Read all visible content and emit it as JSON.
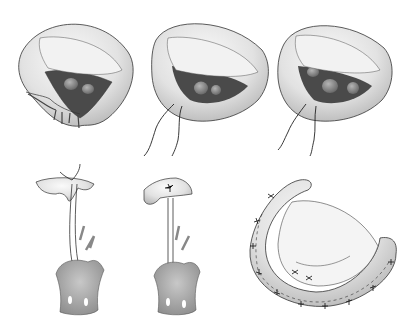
{
  "figure": {
    "background": "#ffffff",
    "panels": [
      {
        "id": "valve-1",
        "subject": "mitral valve with prolapsed/ruptured chordae",
        "position": "top-left"
      },
      {
        "id": "valve-2",
        "subject": "mitral valve with artificial chordae sutures",
        "position": "top-center"
      },
      {
        "id": "valve-3",
        "subject": "mitral valve with sutures passed through leaflet",
        "position": "top-right"
      },
      {
        "id": "chord-1",
        "subject": "papillary muscle with neochord loop tied to leaflet",
        "position": "bottom-left"
      },
      {
        "id": "chord-2",
        "subject": "papillary muscle with neochord secured to folded leaflet",
        "position": "bottom-center"
      },
      {
        "id": "ring",
        "subject": "annuloplasty ring sutured around valve",
        "position": "bottom-right"
      }
    ],
    "colors": {
      "tissue_light": "#ececec",
      "tissue_shade": "#c8c8c8",
      "orifice_dark": "#4a4a4a",
      "muscle": "#a9a9a9",
      "outline": "#333333"
    }
  }
}
